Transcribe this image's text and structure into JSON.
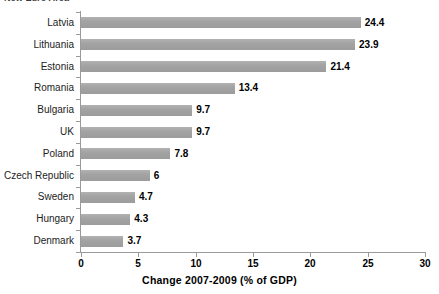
{
  "clipped_title": "New Euro Area",
  "chart_data": {
    "type": "bar",
    "orientation": "horizontal",
    "title": "",
    "xlabel": "Change 2007-2009 (% of GDP)",
    "ylabel": "",
    "categories": [
      "Latvia",
      "Lithuania",
      "Estonia",
      "Romania",
      "Bulgaria",
      "UK",
      "Poland",
      "Czech Republic",
      "Sweden",
      "Hungary",
      "Denmark"
    ],
    "values": [
      24.4,
      23.9,
      21.4,
      13.4,
      9.7,
      9.7,
      7.8,
      6,
      4.7,
      4.3,
      3.7
    ],
    "value_labels": [
      "24.4",
      "23.9",
      "21.4",
      "13.4",
      "9.7",
      "9.7",
      "7.8",
      "6",
      "4.7",
      "4.3",
      "3.7"
    ],
    "xlim": [
      0,
      30
    ],
    "xticks": [
      0,
      5,
      10,
      15,
      20,
      25,
      30
    ],
    "xtick_labels": [
      "0",
      "5",
      "10",
      "15",
      "20",
      "25",
      "30"
    ],
    "grid": false,
    "legend": false,
    "bar_color": "#a6a6a6",
    "axis_color": "#9a9a9a",
    "label_color": "#000000"
  }
}
